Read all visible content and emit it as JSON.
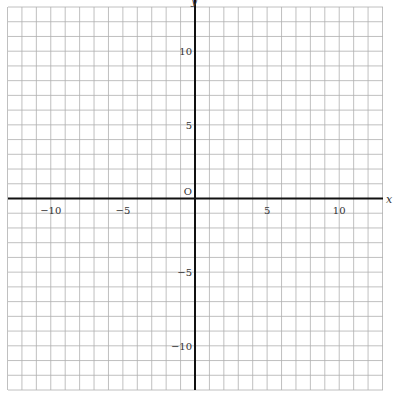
{
  "graph": {
    "x_label": "x",
    "y_label": "y",
    "origin_label": "O",
    "x_range": [
      -13,
      13
    ],
    "y_range": [
      -13,
      13
    ],
    "x_ticks": [
      {
        "value": -10,
        "label": "−10"
      },
      {
        "value": -5,
        "label": "−5"
      },
      {
        "value": 5,
        "label": "5"
      },
      {
        "value": 10,
        "label": "10"
      }
    ],
    "y_ticks": [
      {
        "value": 10,
        "label": "10"
      },
      {
        "value": 5,
        "label": "5"
      },
      {
        "value": -5,
        "label": "−5"
      },
      {
        "value": -10,
        "label": "−10"
      }
    ],
    "colors": {
      "grid": "#b0b0b0",
      "axis": "#111111"
    }
  }
}
